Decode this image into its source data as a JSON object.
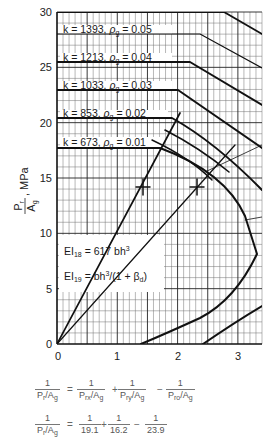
{
  "chart_data": {
    "type": "line",
    "title": "",
    "xlabel": "",
    "ylabel": "P_r / A_g, MPa",
    "xlim": [
      0,
      3.4
    ],
    "ylim": [
      0,
      30
    ],
    "x_ticks": [
      "0",
      "1",
      "2",
      "3"
    ],
    "y_ticks": [
      "0",
      "5",
      "10",
      "15",
      "20",
      "25",
      "30"
    ],
    "grid": true,
    "series": [
      {
        "name": "k = 1393, ρg = 0.05",
        "k": 1393,
        "rho_g": 0.05,
        "points": [
          [
            0,
            28.0
          ],
          [
            2.35,
            28.0
          ],
          [
            3.4,
            25.0
          ]
        ]
      },
      {
        "name": "k = 1213, ρg = 0.04",
        "k": 1213,
        "rho_g": 0.04,
        "points": [
          [
            0,
            25.4
          ],
          [
            2.2,
            25.4
          ],
          [
            3.4,
            21.5
          ]
        ]
      },
      {
        "name": "k = 1033, ρg = 0.03",
        "k": 1033,
        "rho_g": 0.03,
        "points": [
          [
            0,
            22.9
          ],
          [
            2.0,
            22.9
          ],
          [
            3.4,
            17.7
          ]
        ]
      },
      {
        "name": "k = 853, ρg = 0.02",
        "k": 853,
        "rho_g": 0.02,
        "points": [
          [
            0,
            20.4
          ],
          [
            1.9,
            20.4
          ],
          [
            2.6,
            17.0
          ],
          [
            3.4,
            13.9
          ],
          [
            3.4,
            3.4
          ],
          [
            2.4,
            0
          ]
        ]
      },
      {
        "name": "k = 673, ρg = 0.01",
        "k": 673,
        "rho_g": 0.01,
        "points": [
          [
            0,
            17.7
          ],
          [
            1.7,
            17.7
          ],
          [
            2.4,
            15.0
          ],
          [
            3.0,
            11.0
          ],
          [
            3.3,
            8.2
          ],
          [
            3.0,
            4.9
          ],
          [
            2.4,
            2.6
          ],
          [
            1.4,
            0
          ]
        ]
      },
      {
        "name": "Top boundary",
        "points": [
          [
            0,
            30
          ],
          [
            2.75,
            30
          ],
          [
            3.4,
            28.0
          ]
        ]
      },
      {
        "name": "EI18 = 617 bh^3",
        "points": [
          [
            0,
            0
          ],
          [
            1.38,
            14.3
          ],
          [
            2.03,
            20.8
          ]
        ]
      },
      {
        "name": "EI19 = bh^3/(1+βd)",
        "points": [
          [
            0,
            0
          ],
          [
            2.32,
            14.4
          ],
          [
            2.95,
            18.1
          ]
        ]
      }
    ],
    "annotations": [
      {
        "text": "EI18 = 617 bh^3"
      },
      {
        "text": "EI19 = bh^3/(1 + βd)"
      },
      {
        "marker": "+",
        "x": 1.41,
        "y": 14.3
      },
      {
        "marker": "+",
        "x": 2.32,
        "y": 14.3
      }
    ]
  },
  "axes": {
    "y_label_main": "P",
    "y_label_sub": "r",
    "y_label_den": "A",
    "y_label_den_sub": "g",
    "y_label_unit": ", MPa",
    "x_ticks": [
      "0",
      "1",
      "2",
      "3"
    ],
    "y_ticks": [
      "0",
      "5",
      "10",
      "15",
      "20",
      "25",
      "30"
    ]
  },
  "curve_labels": [
    {
      "k": "k = 1393,",
      "rho": "ρ",
      "rho_sub": "g",
      "val": " = 0.05"
    },
    {
      "k": "k = 1213,",
      "rho": "ρ",
      "rho_sub": "g",
      "val": " = 0.04"
    },
    {
      "k": "k = 1033,",
      "rho": "ρ",
      "rho_sub": "g",
      "val": " = 0.03"
    },
    {
      "k": "k =  853,",
      "rho": "ρ",
      "rho_sub": "g",
      "val": " = 0.02"
    },
    {
      "k": "k =  673,",
      "rho": "ρ",
      "rho_sub": "g",
      "val": " = 0.01"
    }
  ],
  "ei_box": {
    "ei18": {
      "base": "EI",
      "sub": "18",
      "rhs": " = 617 bh",
      "sup": "3"
    },
    "ei19": {
      "base": "EI",
      "sub": "19",
      "rhs": " = bh",
      "sup": "3",
      "tail": "/(1 + β",
      "tail_sub": "d",
      "close": ")"
    }
  },
  "formulas": {
    "line1": {
      "lhs_num": "1",
      "lhs_den": "P_r/A_g",
      "op1": "=",
      "t1_num": "1",
      "t1_den": "P_rx/A_g",
      "op2": "+",
      "t2_num": "1",
      "t2_den": "P_ry/A_g",
      "op3": "−",
      "t3_num": "1",
      "t3_den": "P_ro/A_g"
    },
    "line2": {
      "lhs_num": "1",
      "lhs_den": "P_r/A_g",
      "op1": "=",
      "t1_num": "1",
      "t1_den": "19.1",
      "op2": "+",
      "t2_num": "1",
      "t2_den": "16.2",
      "op3": "−",
      "t3_num": "1",
      "t3_den": "23.9"
    }
  }
}
